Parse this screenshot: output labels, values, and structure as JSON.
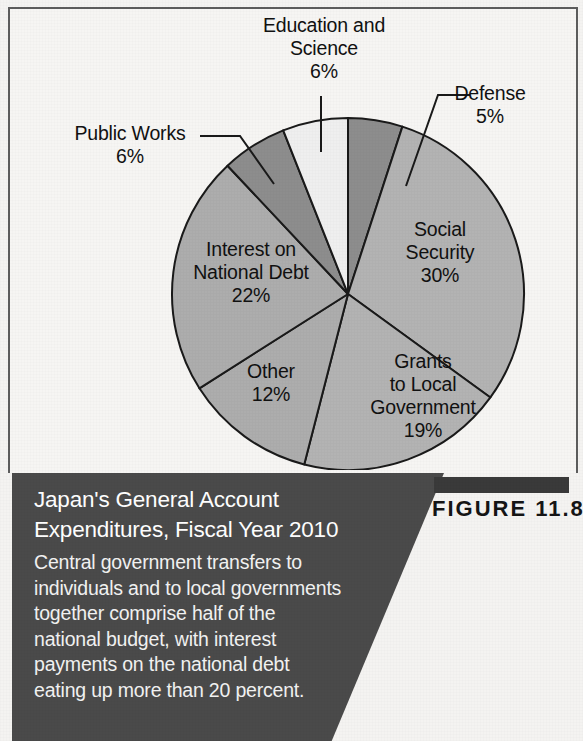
{
  "figure": {
    "number_label": "FIGURE 11.8",
    "caption_title": "Japan's General Account\nExpenditures, Fiscal Year 2010",
    "caption_body": "Central government transfers to\nindividuals and to local governments\ntogether comprise half of the\nnational budget, with interest\npayments on the national debt\neating up more than 20 percent."
  },
  "labels": {
    "education": "Education and\nScience\n6%",
    "defense": "Defense\n5%",
    "public_works": "Public Works\n6%",
    "social_security": "Social\nSecurity\n30%",
    "grants": "Grants\nto Local\nGovernment\n19%",
    "other": "Other\n12%",
    "interest": "Interest on\nNational Debt\n22%"
  },
  "colors": {
    "caption_background": "#4a4a4a",
    "caption_text": "#ffffff",
    "figure_bar": "#3a3a3a",
    "page_background": "#f4f3f1",
    "frame_border": "#5d5d5d",
    "slice_outline": "#1a1a1a"
  },
  "chart_data": {
    "type": "pie",
    "title": "Japan's General Account Expenditures, Fiscal Year 2010",
    "subtitle": "",
    "xlabel": "",
    "ylabel": "",
    "units": "percent",
    "total": 100,
    "legend_position": "none (labels placed on/around slices)",
    "grid": false,
    "start_angle_deg": 0,
    "direction": "clockwise",
    "labels": [
      "Defense",
      "Social Security",
      "Grants to Local Government",
      "Other",
      "Interest on National Debt",
      "Public Works",
      "Education and Science"
    ],
    "values": [
      5,
      30,
      19,
      12,
      22,
      6,
      6
    ],
    "value_labels": [
      "5%",
      "30%",
      "19%",
      "12%",
      "22%",
      "6%",
      "6%"
    ],
    "slices": [
      {
        "name": "Defense",
        "value": 5,
        "label": "5%",
        "color": "#8d8d8d",
        "label_placement": "leader-line-outside"
      },
      {
        "name": "Social Security",
        "value": 30,
        "label": "30%",
        "color": "#b3b3b3",
        "label_placement": "inside"
      },
      {
        "name": "Grants to Local Government",
        "value": 19,
        "label": "19%",
        "color": "#b3b3b3",
        "label_placement": "inside"
      },
      {
        "name": "Other",
        "value": 12,
        "label": "12%",
        "color": "#adadad",
        "label_placement": "inside"
      },
      {
        "name": "Interest on National Debt",
        "value": 22,
        "label": "22%",
        "color": "#adadad",
        "label_placement": "inside"
      },
      {
        "name": "Public Works",
        "value": 6,
        "label": "6%",
        "color": "#8d8d8d",
        "label_placement": "leader-line-outside"
      },
      {
        "name": "Education and Science",
        "value": 6,
        "label": "6%",
        "color": "#efefef",
        "label_placement": "leader-line-outside"
      }
    ]
  }
}
